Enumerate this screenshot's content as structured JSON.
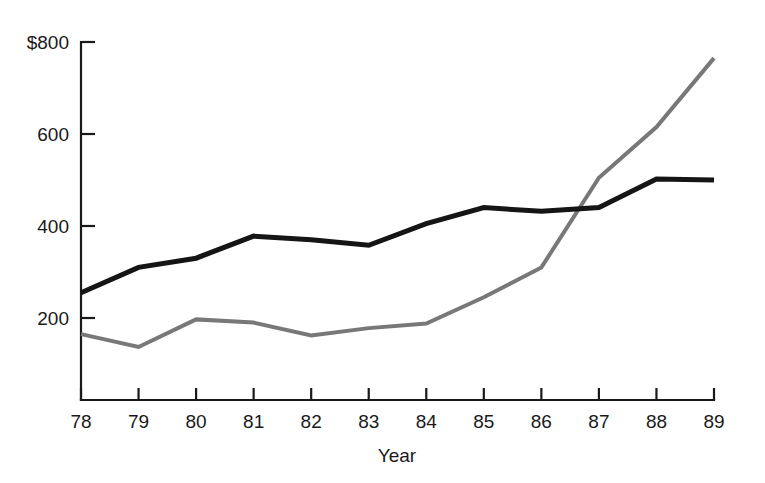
{
  "chart_data": {
    "type": "line",
    "title": "",
    "subtitle": "",
    "xlabel": "Year",
    "ylabel": "",
    "categories": [
      "78",
      "79",
      "80",
      "81",
      "82",
      "83",
      "84",
      "85",
      "86",
      "87",
      "88",
      "89"
    ],
    "x": [
      78,
      79,
      80,
      81,
      82,
      83,
      84,
      85,
      86,
      87,
      88,
      89
    ],
    "series": [
      {
        "name": "black-series",
        "color": "#151515",
        "stroke_width": 5,
        "values": [
          255,
          310,
          330,
          378,
          370,
          358,
          405,
          440,
          432,
          440,
          502,
          500
        ]
      },
      {
        "name": "gray-series",
        "color": "#787878",
        "stroke_width": 4,
        "values": [
          165,
          137,
          197,
          190,
          162,
          178,
          188,
          245,
          310,
          505,
          615,
          765
        ]
      }
    ],
    "ylim": [
      0,
      800
    ],
    "xlim": [
      78,
      89
    ],
    "y_ticks": [
      200,
      400,
      600,
      800
    ],
    "y_tick_labels": [
      "200",
      "400",
      "600",
      "$800"
    ],
    "x_ticks": [
      78,
      79,
      80,
      81,
      82,
      83,
      84,
      85,
      86,
      87,
      88,
      89
    ],
    "x_tick_labels": [
      "78",
      "79",
      "80",
      "81",
      "82",
      "83",
      "84",
      "85",
      "86",
      "87",
      "88",
      "89"
    ],
    "grid": false,
    "legend": false,
    "legend_position": "none",
    "annotations": []
  },
  "axis": {
    "currency_symbol": "$",
    "y_top_label": "$800",
    "y_labels": [
      "$800",
      "600",
      "400",
      "200"
    ],
    "x_axis_title": "Year"
  }
}
